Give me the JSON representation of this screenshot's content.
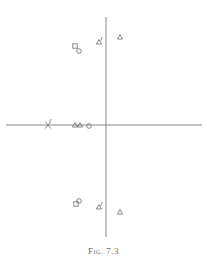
{
  "figure": {
    "caption": "Fig. 7.3",
    "background": "#ffffff",
    "ink_color": "#6a6a6a"
  },
  "chart_data": {
    "type": "scatter",
    "title": "",
    "caption": "Fig. 7.3",
    "xlabel": "",
    "ylabel": "",
    "grid": false,
    "legend": null,
    "axes": {
      "origin_px": [
        106,
        125
      ],
      "x_range_px": [
        6,
        202
      ],
      "y_range_px": [
        17,
        237
      ],
      "units_per_px": 0.1
    },
    "series": [
      {
        "name": "triangle",
        "marker": "triangle",
        "points": [
          {
            "x": 1.4,
            "y": 8.8
          },
          {
            "x": 1.4,
            "y": -8.7
          },
          {
            "x": -3.1,
            "y": 0.0
          },
          {
            "x": -2.6,
            "y": 0.0
          }
        ]
      },
      {
        "name": "triangle-primed",
        "marker": "triangle-with-tick",
        "points": [
          {
            "x": -0.7,
            "y": 8.3
          },
          {
            "x": -0.7,
            "y": -8.2
          }
        ]
      },
      {
        "name": "square",
        "marker": "square",
        "points": [
          {
            "x": -3.1,
            "y": 7.9
          },
          {
            "x": -3.0,
            "y": -7.9
          }
        ]
      },
      {
        "name": "circle",
        "marker": "circle",
        "points": [
          {
            "x": -2.7,
            "y": 7.4
          },
          {
            "x": -2.7,
            "y": -7.6
          },
          {
            "x": -1.7,
            "y": -0.1
          }
        ]
      },
      {
        "name": "cross",
        "marker": "cross",
        "points": [
          {
            "x": -5.8,
            "y": 0.0
          }
        ]
      }
    ]
  }
}
